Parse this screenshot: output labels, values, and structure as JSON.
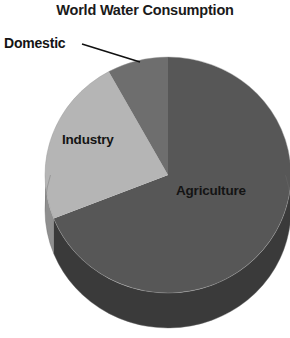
{
  "chart_title": "World Water Consumption",
  "labels": {
    "domestic": "Domestic",
    "industry": "Industry",
    "agriculture": "Agriculture"
  },
  "chart_data": {
    "type": "pie",
    "title": "World Water Consumption",
    "subtitle": "",
    "xlabel": "",
    "ylabel": "",
    "categories": [
      "Agriculture",
      "Industry",
      "Domestic"
    ],
    "values": [
      69,
      23,
      8
    ],
    "unit": "percent",
    "labels_shown": [
      "Agriculture",
      "Industry",
      "Domestic"
    ],
    "value_labels_shown": false,
    "legend": false,
    "legend_position": "none",
    "grid": false,
    "three_d": true,
    "start_angle_deg": 0,
    "direction": "clockwise",
    "slices": [
      {
        "name": "Agriculture",
        "value": 69,
        "color": "#575757",
        "side_color": "#3a3a3a",
        "start_deg": 0,
        "end_deg": 248.4,
        "label_position": "inside-right"
      },
      {
        "name": "Industry",
        "value": 23,
        "color": "#b5b5b5",
        "side_color": "#8f8f8f",
        "start_deg": 248.4,
        "end_deg": 331.2,
        "label_position": "inside-left"
      },
      {
        "name": "Domestic",
        "value": 8,
        "color": "#6e6e6e",
        "side_color": "#4d4d4d",
        "start_deg": 331.2,
        "end_deg": 360,
        "label_position": "outside-upper-left-with-leader"
      }
    ]
  },
  "colors": {
    "background": "#ffffff",
    "title_text": "#1a1a1a",
    "label_text": "#141414",
    "agriculture_top": "#575757",
    "industry_top": "#b5b5b5",
    "domestic_top": "#6e6e6e",
    "agriculture_side": "#3a3a3a",
    "industry_side": "#8f8f8f",
    "leader_line": "#111111",
    "outline": "#9a9a9a"
  }
}
